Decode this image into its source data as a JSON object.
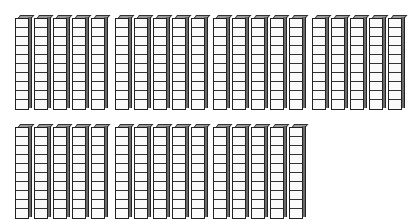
{
  "figure": {
    "type": "base-ten-blocks",
    "block_kind": "tens rods",
    "cubes_per_rod": 10,
    "rows": [
      {
        "groups": [
          5,
          5,
          5,
          5
        ],
        "top": 15
      },
      {
        "groups": [
          5,
          5,
          5
        ],
        "top": 124
      }
    ],
    "group_left_positions": [
      15,
      115,
      213,
      312
    ],
    "rod_pitch": 19,
    "total_rods": 35,
    "represented_value": 350,
    "colors": {
      "cube_face": "#fafafa",
      "outline": "#222222",
      "side_shade": "#6a6a6a",
      "top_shade": "#9a9a9a"
    }
  }
}
